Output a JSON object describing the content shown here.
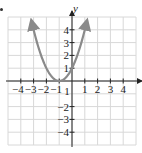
{
  "chart_data": {
    "type": "line",
    "title": "",
    "xlabel": "x",
    "ylabel": "y",
    "xlim": [
      -5,
      5
    ],
    "ylim": [
      -5,
      5
    ],
    "grid": true,
    "x_ticks": [
      -4,
      -3,
      -2,
      -1,
      1,
      2,
      3,
      4
    ],
    "y_ticks": [
      -4,
      -3,
      -2,
      1,
      2,
      3,
      4
    ],
    "x_tick_labels": [
      "−4",
      "−3",
      "−2",
      "−1",
      "1",
      "2",
      "3",
      "4"
    ],
    "y_tick_labels": [
      "−4",
      "−3",
      "−2",
      "1",
      "2",
      "3",
      "4"
    ],
    "series": [
      {
        "name": "y = (x + 1)^2",
        "color": "#8a8a8a",
        "x": [
          -3.15,
          -3,
          -2.5,
          -2,
          -1.5,
          -1,
          -0.5,
          0,
          0.5,
          1.15
        ],
        "values": [
          4.62,
          4,
          2.25,
          1,
          0.25,
          0,
          0.25,
          1,
          2.25,
          4.62
        ],
        "arrows_both_ends": true
      }
    ]
  },
  "colors": {
    "grid": "#d8d8d8",
    "axis": "#222222",
    "curve": "#8a8a8a"
  }
}
